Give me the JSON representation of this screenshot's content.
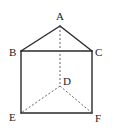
{
  "diagram": {
    "type": "triangular-prism",
    "colors": {
      "line": "#2a2a2a",
      "hidden_line": "#555555",
      "label": "#222222",
      "background": "#ffffff"
    },
    "vertices": {
      "A": {
        "label": "A",
        "x": 60,
        "y": 26,
        "lx": 56,
        "ly": 20
      },
      "B": {
        "label": "B",
        "x": 21,
        "y": 51,
        "lx": 9,
        "ly": 56
      },
      "C": {
        "label": "C",
        "x": 92,
        "y": 51,
        "lx": 95,
        "ly": 56
      },
      "D": {
        "label": "D",
        "x": 60,
        "y": 86,
        "lx": 63,
        "ly": 85
      },
      "E": {
        "label": "E",
        "x": 21,
        "y": 113,
        "lx": 9,
        "ly": 121
      },
      "F": {
        "label": "F",
        "x": 92,
        "y": 113,
        "lx": 95,
        "ly": 122
      }
    },
    "solid_edges": [
      "AB",
      "AC",
      "BC",
      "BE",
      "CF",
      "EF"
    ],
    "dashed_edges": [
      "AD",
      "DE",
      "DF"
    ]
  }
}
